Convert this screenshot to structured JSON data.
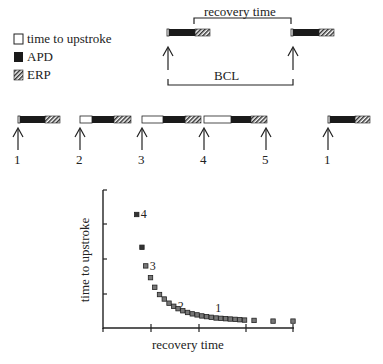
{
  "legend": {
    "items": [
      {
        "key": "time_to_upstroke",
        "label": "time to upstroke",
        "swatch": "white"
      },
      {
        "key": "apd",
        "label": "APD",
        "swatch": "black"
      },
      {
        "key": "erp",
        "label": "ERP",
        "swatch": "hatched"
      }
    ]
  },
  "schematic": {
    "recovery_label": "recovery time",
    "bcl_label": "BCL"
  },
  "sequence": {
    "stimuli": [
      {
        "label": "1",
        "x": 18,
        "white": 2,
        "black": 26,
        "hatch": 14
      },
      {
        "label": "2",
        "x": 79,
        "white": 12,
        "black": 22,
        "hatch": 18
      },
      {
        "label": "3",
        "x": 141,
        "white": 21,
        "black": 22,
        "hatch": 17
      },
      {
        "label": "4",
        "x": 203,
        "white": 27,
        "black": 21,
        "hatch": 18
      },
      {
        "label": "5",
        "x": 266,
        "white": 0,
        "black": 0,
        "hatch": 0
      },
      {
        "label": "1",
        "x": 328,
        "white": 2,
        "black": 26,
        "hatch": 14
      }
    ]
  },
  "chart_data": {
    "type": "scatter",
    "title": "",
    "xlabel": "recovery time",
    "ylabel": "time to upstroke",
    "grid": false,
    "legend": null,
    "axis_ticks": {
      "x": 4,
      "y": 4
    },
    "xlim": [
      0,
      4
    ],
    "ylim": [
      0,
      4
    ],
    "points": [
      {
        "x": 0.71,
        "y": 3.29,
        "label": "4"
      },
      {
        "x": 0.82,
        "y": 2.34
      },
      {
        "x": 0.9,
        "y": 1.8,
        "label": "3"
      },
      {
        "x": 1.0,
        "y": 1.46
      },
      {
        "x": 1.09,
        "y": 1.18
      },
      {
        "x": 1.19,
        "y": 0.97
      },
      {
        "x": 1.29,
        "y": 0.84
      },
      {
        "x": 1.39,
        "y": 0.72
      },
      {
        "x": 1.49,
        "y": 0.63,
        "label": "2"
      },
      {
        "x": 1.58,
        "y": 0.56
      },
      {
        "x": 1.68,
        "y": 0.5
      },
      {
        "x": 1.78,
        "y": 0.45
      },
      {
        "x": 1.88,
        "y": 0.41
      },
      {
        "x": 1.98,
        "y": 0.38
      },
      {
        "x": 2.08,
        "y": 0.35
      },
      {
        "x": 2.18,
        "y": 0.33
      },
      {
        "x": 2.28,
        "y": 0.31,
        "label": "1"
      },
      {
        "x": 2.38,
        "y": 0.29
      },
      {
        "x": 2.48,
        "y": 0.28
      },
      {
        "x": 2.58,
        "y": 0.27
      },
      {
        "x": 2.68,
        "y": 0.26
      },
      {
        "x": 2.78,
        "y": 0.25
      },
      {
        "x": 2.88,
        "y": 0.24
      },
      {
        "x": 2.98,
        "y": 0.23
      },
      {
        "x": 3.18,
        "y": 0.22
      },
      {
        "x": 3.58,
        "y": 0.2
      },
      {
        "x": 4.0,
        "y": 0.2
      }
    ]
  }
}
